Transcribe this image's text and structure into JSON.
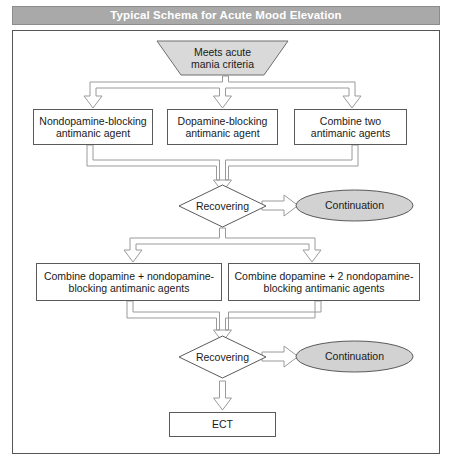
{
  "figure": {
    "title": "Typical Schema for Acute Mood Elevation",
    "colors": {
      "title_bar_fill": "#a9a9a9",
      "title_text": "#ffffff",
      "shape_gray_fill": "#d9d9d9",
      "shape_white_fill": "#ffffff",
      "shape_stroke": "#5a5a5a",
      "connector_stroke": "#9a9a9a",
      "connector_fill": "#ffffff",
      "frame_stroke": "#555555"
    }
  },
  "nodes": {
    "entry": {
      "shape": "trapezoid",
      "label": "Meets acute\nmania criteria"
    },
    "option_1": {
      "shape": "rectangle",
      "label": "Nondopamine-blocking\nantimanic agent"
    },
    "option_2": {
      "shape": "rectangle",
      "label": "Dopamine-blocking\nantimanic agent"
    },
    "option_3": {
      "shape": "rectangle",
      "label": "Combine two\nantimanic agents"
    },
    "decision_1": {
      "shape": "diamond",
      "label": "Recovering"
    },
    "continuation_1": {
      "shape": "ellipse",
      "label": "Continuation"
    },
    "combo_1": {
      "shape": "rectangle",
      "label": "Combine dopamine + nondopamine-\nblocking antimanic agents"
    },
    "combo_2": {
      "shape": "rectangle",
      "label": "Combine dopamine + 2 nondopamine-\nblocking antimanic agents"
    },
    "decision_2": {
      "shape": "diamond",
      "label": "Recovering"
    },
    "continuation_2": {
      "shape": "ellipse",
      "label": "Continuation"
    },
    "terminal": {
      "shape": "rectangle",
      "label": "ECT"
    }
  },
  "connectors": [
    {
      "name": "entry-to-options-split",
      "from": "entry",
      "to": [
        "option_1",
        "option_2",
        "option_3"
      ],
      "style": "block-arrow-split-down"
    },
    {
      "name": "options-to-decision-1-merge",
      "from": [
        "option_1",
        "option_2",
        "option_3"
      ],
      "to": "decision_1",
      "style": "block-arrow-merge-down"
    },
    {
      "name": "decision-1-to-continuation-1",
      "from": "decision_1",
      "to": "continuation_1",
      "style": "block-arrow-right"
    },
    {
      "name": "decision-1-to-combos-split",
      "from": "decision_1",
      "to": [
        "combo_1",
        "combo_2"
      ],
      "style": "block-arrow-split-down"
    },
    {
      "name": "combos-to-decision-2-merge",
      "from": [
        "combo_1",
        "combo_2"
      ],
      "to": "decision_2",
      "style": "block-arrow-merge-down"
    },
    {
      "name": "decision-2-to-continuation-2",
      "from": "decision_2",
      "to": "continuation_2",
      "style": "block-arrow-right"
    },
    {
      "name": "decision-2-to-terminal",
      "from": "decision_2",
      "to": "terminal",
      "style": "block-arrow-down"
    }
  ]
}
